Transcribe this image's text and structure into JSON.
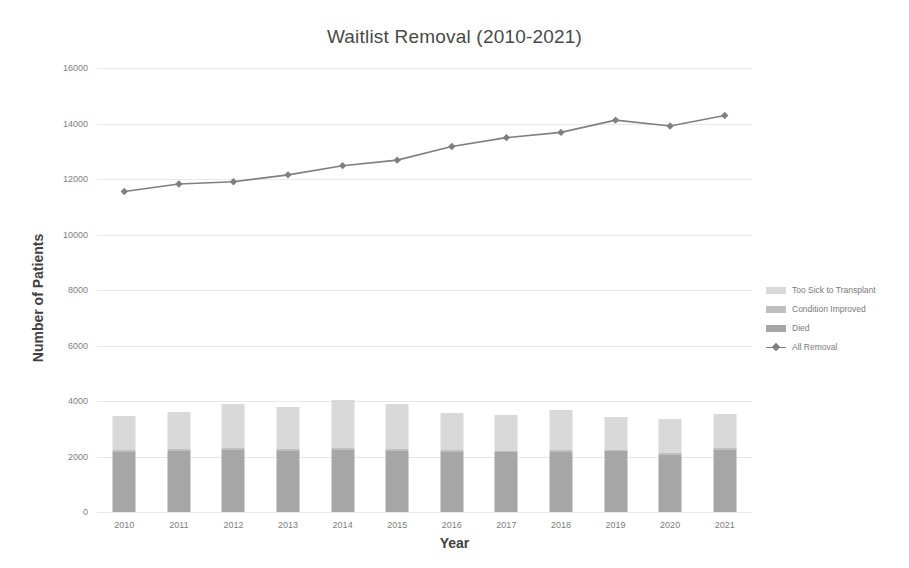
{
  "chart_data": {
    "type": "bar",
    "title": "Waitlist Removal (2010-2021)",
    "xlabel": "Year",
    "ylabel": "Number of Patients",
    "ylim": [
      0,
      16000
    ],
    "yticks": [
      0,
      2000,
      4000,
      6000,
      8000,
      10000,
      12000,
      14000,
      16000
    ],
    "grid": true,
    "legend_position": "right",
    "stacked": true,
    "categories": [
      "2010",
      "2011",
      "2012",
      "2013",
      "2014",
      "2015",
      "2016",
      "2017",
      "2018",
      "2019",
      "2020",
      "2021"
    ],
    "series": [
      {
        "name": "Died",
        "type": "bar",
        "color": "#a6a6a6",
        "values": [
          2180,
          2200,
          2230,
          2210,
          2240,
          2200,
          2160,
          2150,
          2170,
          2190,
          2060,
          2230
        ]
      },
      {
        "name": "Condition Improved",
        "type": "bar",
        "color": "#bfbfbf",
        "values": [
          60,
          60,
          65,
          60,
          65,
          60,
          60,
          60,
          60,
          60,
          55,
          60
        ]
      },
      {
        "name": "Too Sick to Transplant",
        "type": "bar",
        "color": "#d9d9d9",
        "values": [
          1230,
          1330,
          1580,
          1520,
          1740,
          1630,
          1340,
          1300,
          1430,
          1160,
          1230,
          1230
        ]
      },
      {
        "name": "All Removal",
        "type": "line",
        "color": "#7f7f7f",
        "marker": "diamond",
        "values": [
          11550,
          11820,
          11900,
          12150,
          12480,
          12680,
          13170,
          13490,
          13680,
          14120,
          13910,
          14290
        ]
      }
    ]
  },
  "legend": {
    "items": [
      {
        "label": "Too Sick to Transplant",
        "kind": "swatch",
        "color": "#d9d9d9"
      },
      {
        "label": "Condition Improved",
        "kind": "swatch",
        "color": "#bfbfbf"
      },
      {
        "label": "Died",
        "kind": "swatch",
        "color": "#a6a6a6"
      },
      {
        "label": "All Removal",
        "kind": "line",
        "color": "#7f7f7f"
      }
    ]
  }
}
